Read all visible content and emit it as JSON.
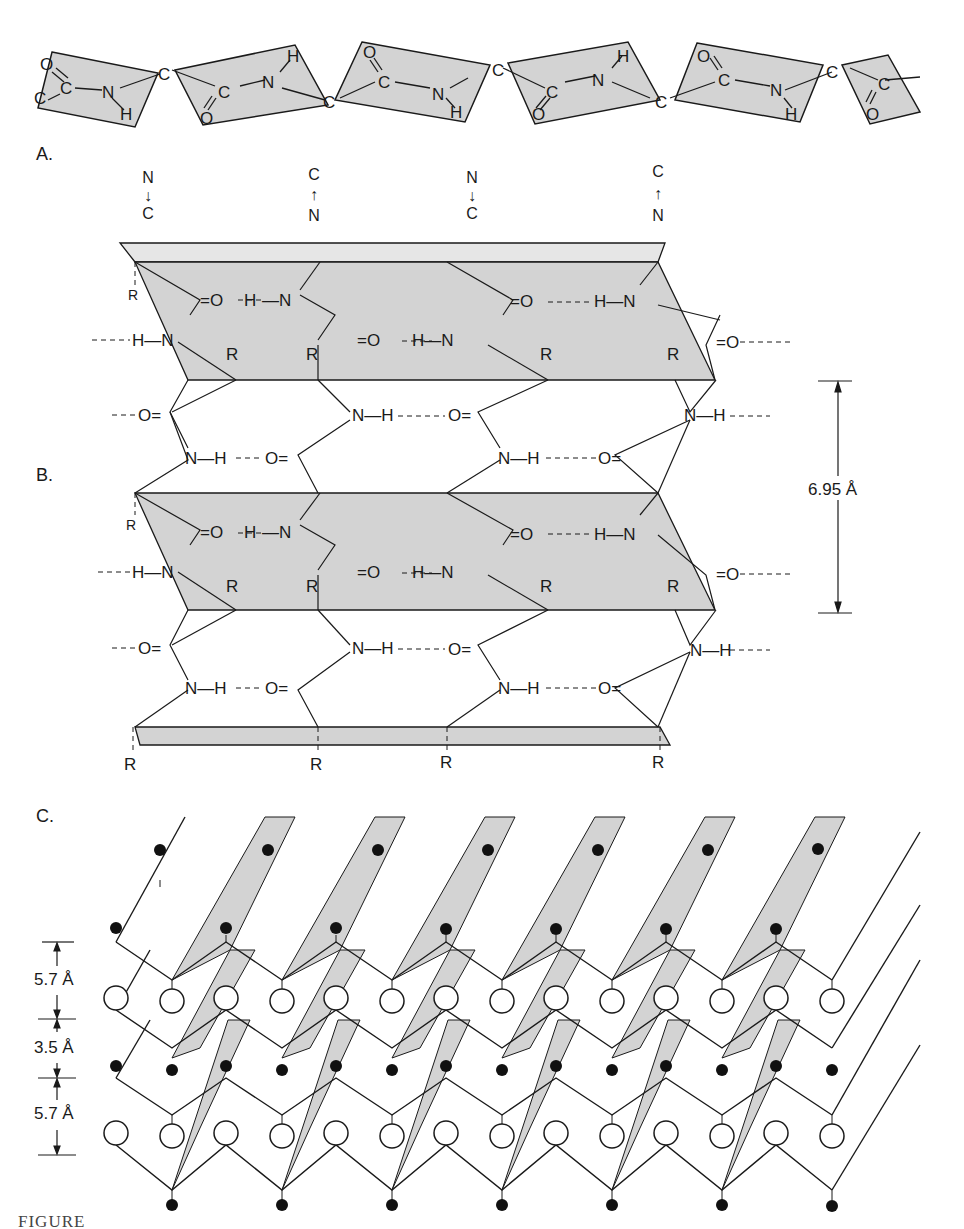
{
  "figure": {
    "colors": {
      "sheet_gray": "#d3d3d3",
      "line": "#1a1a1a",
      "background": "#ffffff"
    },
    "panels": {
      "A": {
        "label": "A.",
        "description": "extended polypeptide chain with planar peptide units",
        "atoms": {
          "carbon": "C",
          "nitrogen": "N",
          "oxygen": "O",
          "hydrogen": "H"
        }
      },
      "B": {
        "label": "B.",
        "description": "antiparallel pleated sheet hydrogen bonding",
        "strand_directions": [
          {
            "top": "N",
            "bottom": "C",
            "arrow": "down"
          },
          {
            "top": "C",
            "bottom": "N",
            "arrow": "up"
          },
          {
            "top": "N",
            "bottom": "C",
            "arrow": "down"
          },
          {
            "top": "C",
            "bottom": "N",
            "arrow": "up"
          }
        ],
        "side_chain": "R",
        "bond_labels": {
          "carbonyl": "=O",
          "amide": "H—N",
          "nh": "N—H",
          "oc": "O="
        },
        "dimension": "6.95 Å"
      },
      "C": {
        "label": "C.",
        "description": "stacked pleated sheets",
        "dimensions": [
          "5.7 Å",
          "3.5 Å",
          "5.7 Å"
        ]
      }
    },
    "caption_partial": "FIGURE"
  }
}
